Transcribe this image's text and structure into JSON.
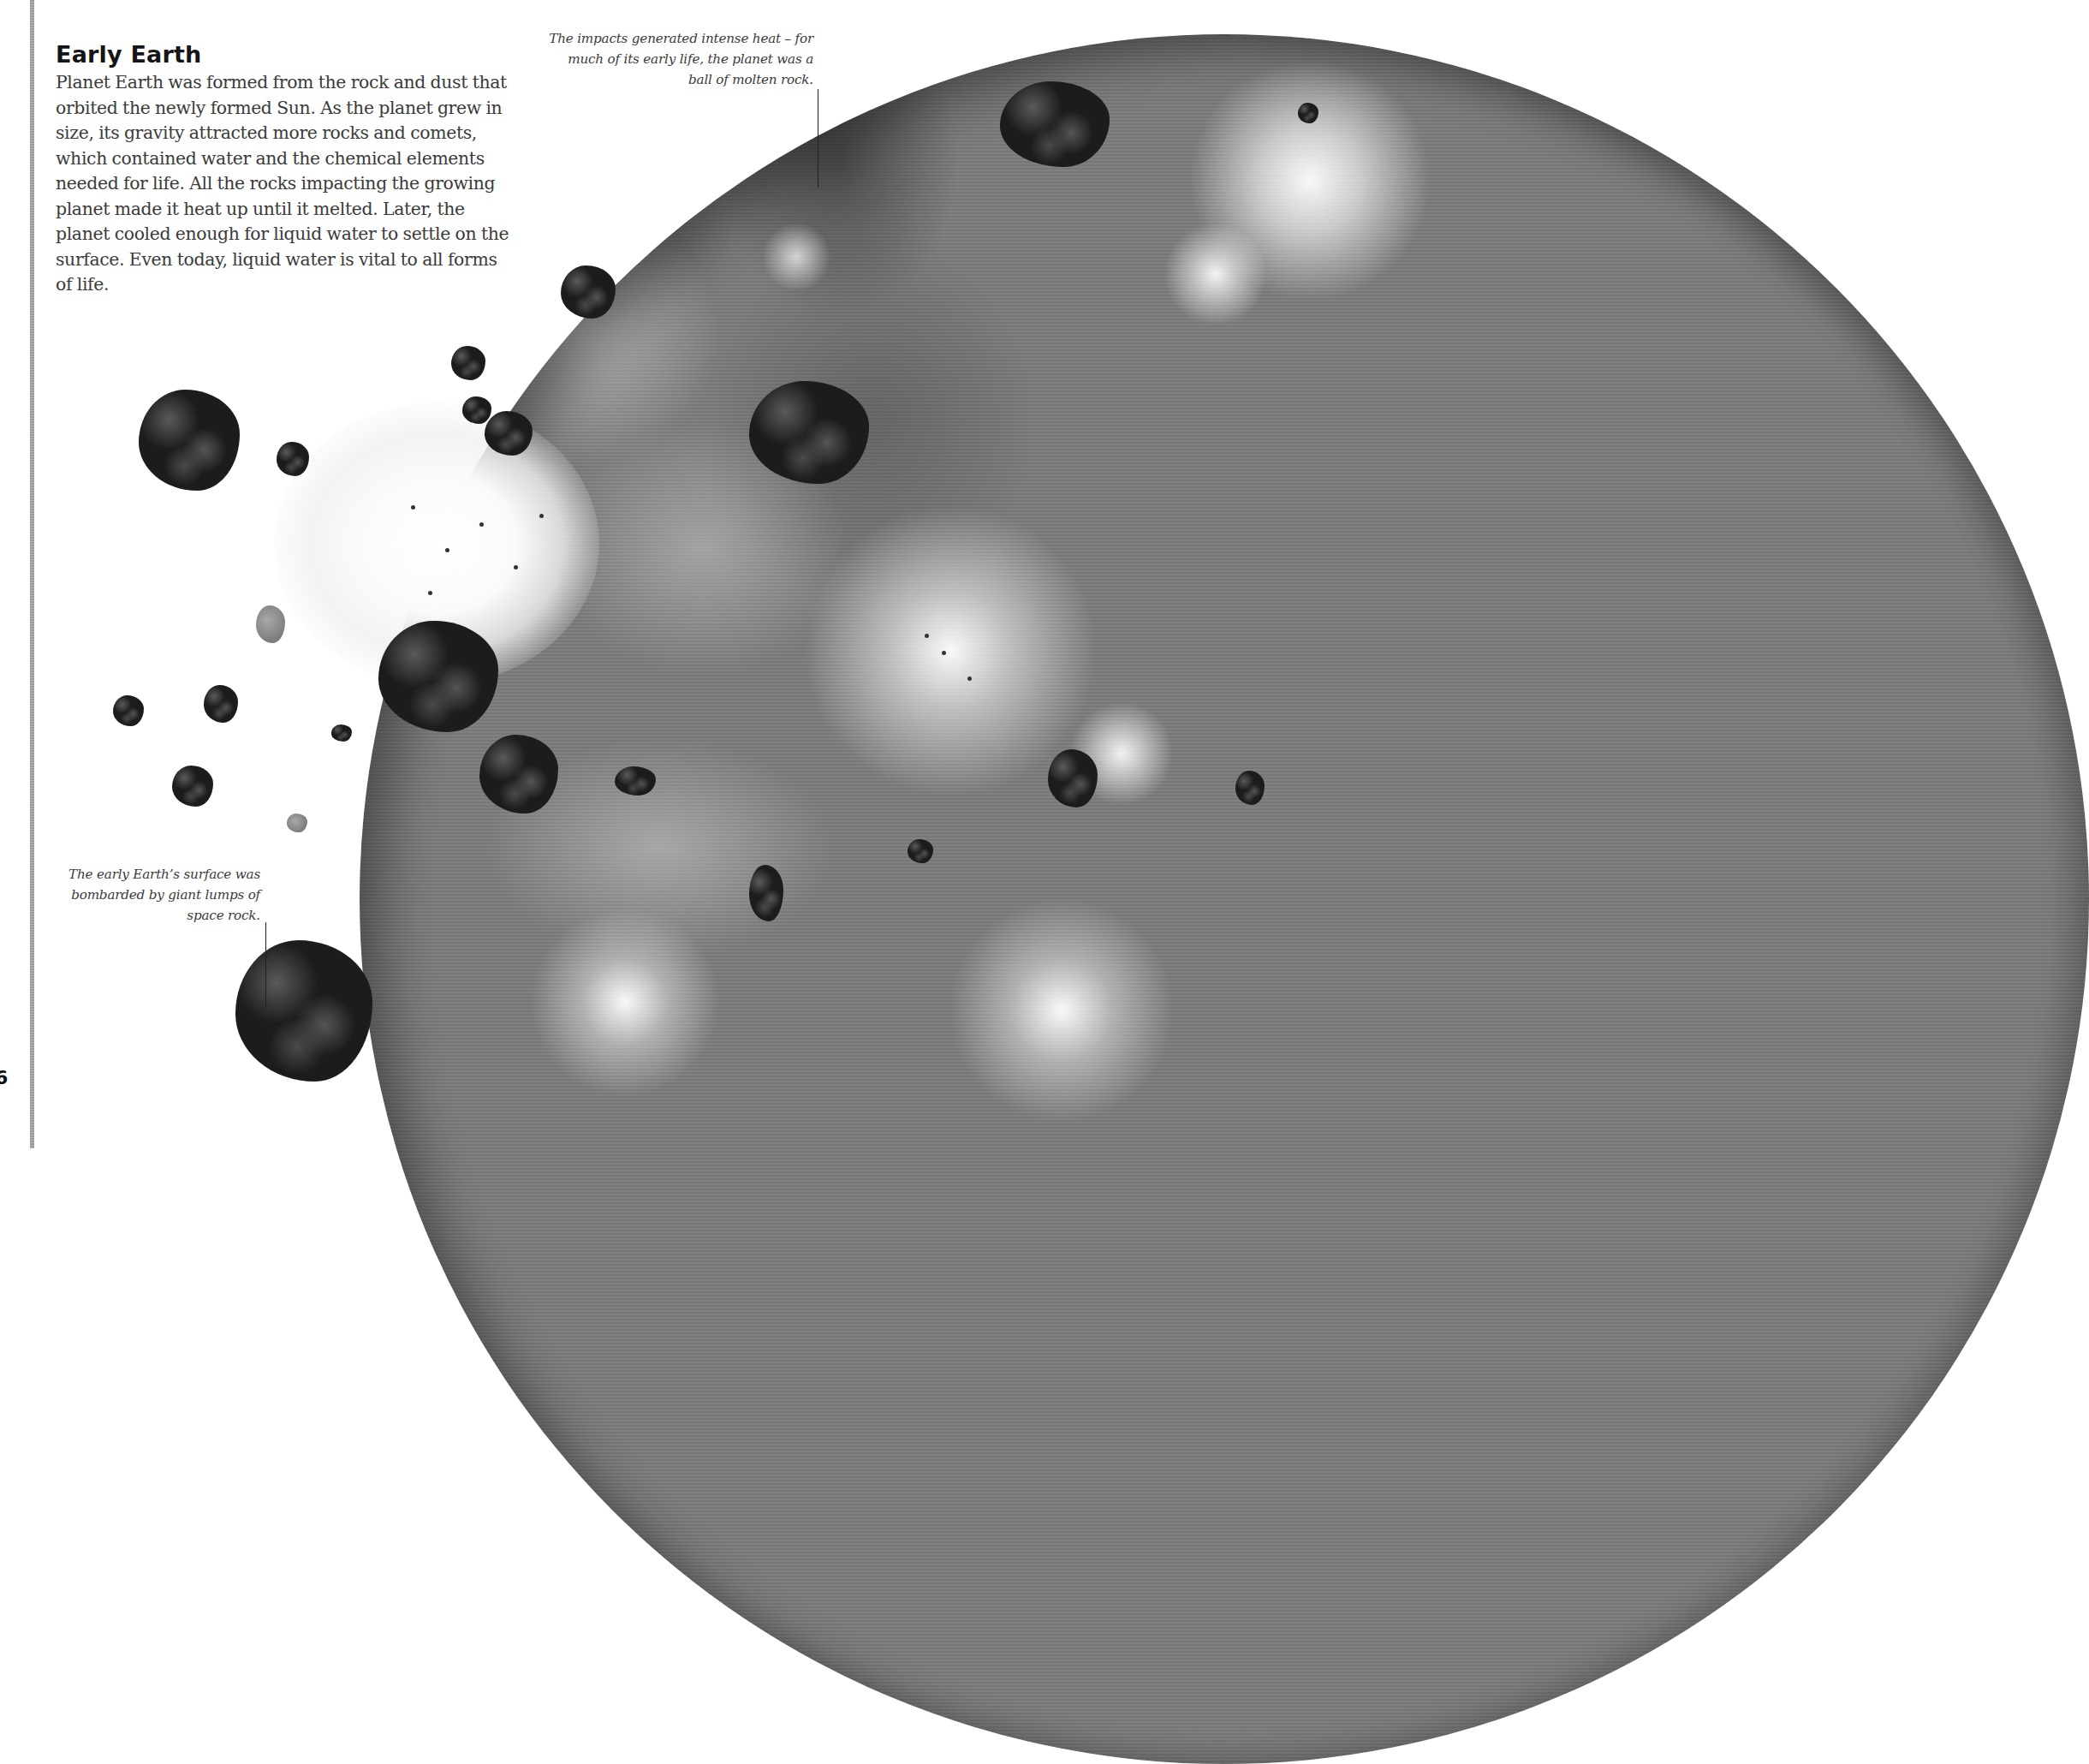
{
  "page": {
    "page_number": "6",
    "background_color": "#ffffff",
    "rule_color": "#a8a8a8"
  },
  "intro": {
    "title": "Early Earth",
    "body": "Planet Earth was formed from the rock and dust that orbited the newly formed Sun. As the planet grew in size, its gravity attracted more rocks and comets, which contained water and the chemical elements needed for life. All the rocks impacting the growing planet made it heat up until it melted. Later, the planet cooled enough for liquid water to settle on the surface. Even today, liquid water is vital to all forms of life."
  },
  "captions": {
    "top": "The impacts generated intense heat – for much of its early life, the planet was a ball of molten rock.",
    "bottom": "The early Earth’s surface was bombarded by giant lumps of space rock."
  },
  "illustration": {
    "subject": "early-earth-planet-with-asteroid-impacts",
    "planet_tone": "#7c7c7c",
    "rock_tone": "#1c1c1c",
    "impact_glow": "#ffffff"
  }
}
